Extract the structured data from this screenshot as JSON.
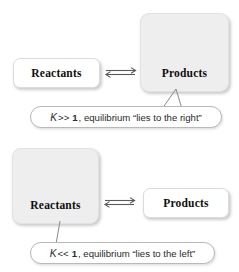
{
  "figure": {
    "type": "chemistry-equilibrium-diagram",
    "panels": [
      {
        "id": "right-shifted",
        "left_box": {
          "label": "Reactants",
          "size": "small",
          "fill": "#ffffff"
        },
        "arrow": {
          "icon": "equilibrium-double-arrow",
          "glyph": "⇌"
        },
        "right_box": {
          "label": "Products",
          "size": "large",
          "fill": "#eeeeee"
        },
        "caption": {
          "k_symbol": "K",
          "comparison": ">>",
          "k_value": "1",
          "rest": ", equilibrium “lies to the right”",
          "full_text": "K >> 1, equilibrium “lies to the right”"
        }
      },
      {
        "id": "left-shifted",
        "left_box": {
          "label": "Reactants",
          "size": "large",
          "fill": "#eeeeee"
        },
        "arrow": {
          "icon": "equilibrium-double-arrow",
          "glyph": "⇌"
        },
        "right_box": {
          "label": "Products",
          "size": "small",
          "fill": "#ffffff"
        },
        "caption": {
          "k_symbol": "K",
          "comparison": "<<",
          "k_value": "1",
          "rest": ", equilibrium “lies to the left”",
          "full_text": "K << 1, equilibrium “lies to the left”"
        }
      }
    ],
    "colors": {
      "background": "#ffffff",
      "large_box_fill": "#eeeeee",
      "small_box_fill": "#ffffff",
      "box_border": "#dcdcdc",
      "bubble_border": "#b9b9b9",
      "text": "#0f0f0f",
      "caption_text": "#2a2a2a",
      "line": "#777777"
    }
  }
}
